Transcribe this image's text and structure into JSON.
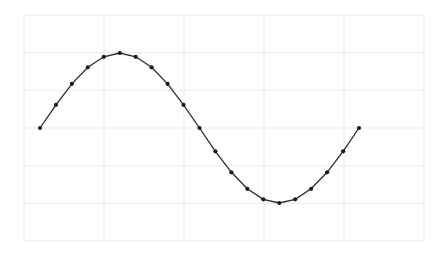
{
  "chart_data": {
    "type": "line",
    "title": "",
    "xlabel": "",
    "ylabel": "",
    "grid": true,
    "legend": null,
    "x": [
      0,
      1,
      2,
      3,
      4,
      5,
      6,
      7,
      8,
      9,
      10,
      11,
      12,
      13,
      14,
      15,
      16,
      17,
      18,
      19,
      20
    ],
    "series": [
      {
        "name": "sine",
        "marker": "circle",
        "values": [
          0.0,
          0.31,
          0.59,
          0.81,
          0.95,
          1.0,
          0.95,
          0.81,
          0.59,
          0.31,
          0.0,
          -0.31,
          -0.59,
          -0.81,
          -0.95,
          -1.0,
          -0.95,
          -0.81,
          -0.59,
          -0.31,
          0.0
        ]
      }
    ],
    "xlim": [
      -1,
      24
    ],
    "ylim": [
      -1.5,
      1.5
    ],
    "xticks_count": 6,
    "yticks_count": 7
  },
  "style": {
    "line_color": "#2a2a2a",
    "marker_color": "#1a1a1a",
    "grid_color": "#ebebeb",
    "background": "#ffffff"
  },
  "layout": {
    "plot_left": 24,
    "plot_right": 424,
    "plot_top": 15,
    "plot_bottom": 241,
    "x0_px": 40,
    "x_step_px": 15.95,
    "y_zero_px": 128,
    "y_unit_px": 75
  }
}
